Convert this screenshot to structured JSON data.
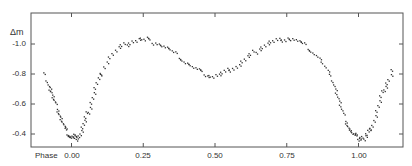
{
  "chart_data": {
    "type": "scatter",
    "title": "",
    "xlabel": "Phase",
    "ylabel": "Δm",
    "xlim": [
      -0.14,
      1.16
    ],
    "ylim": [
      -0.35,
      -1.13
    ],
    "y_inverted": true,
    "grid": false,
    "legend": null,
    "x_ticks": [
      0.0,
      0.25,
      0.5,
      0.75,
      1.0
    ],
    "x_tick_labels": [
      "0.00",
      "0.25",
      "0.50",
      "0.75",
      "1.00"
    ],
    "y_ticks": [
      -1.0,
      -0.8,
      -0.6,
      -0.4
    ],
    "y_tick_labels": [
      "-1.0",
      "-0.8",
      "-0.6",
      "-0.4"
    ],
    "series": [
      {
        "name": "light curve",
        "marker": "dot",
        "points": [
          [
            -0.095,
            -0.8
          ],
          [
            -0.09,
            -0.77
          ],
          [
            -0.085,
            -0.74
          ],
          [
            -0.08,
            -0.72
          ],
          [
            -0.078,
            -0.7
          ],
          [
            -0.075,
            -0.69
          ],
          [
            -0.07,
            -0.66
          ],
          [
            -0.066,
            -0.64
          ],
          [
            -0.062,
            -0.62
          ],
          [
            -0.058,
            -0.6
          ],
          [
            -0.055,
            -0.58
          ],
          [
            -0.05,
            -0.56
          ],
          [
            -0.046,
            -0.54
          ],
          [
            -0.042,
            -0.52
          ],
          [
            -0.038,
            -0.5
          ],
          [
            -0.034,
            -0.48
          ],
          [
            -0.03,
            -0.46
          ],
          [
            -0.026,
            -0.44
          ],
          [
            -0.022,
            -0.43
          ],
          [
            -0.018,
            -0.41
          ],
          [
            -0.014,
            -0.4
          ],
          [
            -0.01,
            -0.4
          ],
          [
            -0.006,
            -0.39
          ],
          [
            -0.002,
            -0.39
          ],
          [
            0.002,
            -0.4
          ],
          [
            0.006,
            -0.38
          ],
          [
            0.01,
            -0.39
          ],
          [
            0.014,
            -0.37
          ],
          [
            0.018,
            -0.38
          ],
          [
            0.022,
            -0.4
          ],
          [
            0.026,
            -0.41
          ],
          [
            0.03,
            -0.43
          ],
          [
            0.034,
            -0.45
          ],
          [
            0.038,
            -0.47
          ],
          [
            0.042,
            -0.49
          ],
          [
            0.046,
            -0.51
          ],
          [
            0.05,
            -0.54
          ],
          [
            0.055,
            -0.56
          ],
          [
            0.06,
            -0.59
          ],
          [
            0.065,
            -0.62
          ],
          [
            0.07,
            -0.65
          ],
          [
            0.075,
            -0.68
          ],
          [
            0.08,
            -0.71
          ],
          [
            0.085,
            -0.74
          ],
          [
            0.09,
            -0.77
          ],
          [
            0.095,
            -0.79
          ],
          [
            0.1,
            -0.82
          ],
          [
            0.11,
            -0.86
          ],
          [
            0.12,
            -0.89
          ],
          [
            0.13,
            -0.92
          ],
          [
            0.14,
            -0.94
          ],
          [
            0.15,
            -0.96
          ],
          [
            0.16,
            -0.98
          ],
          [
            0.17,
            -0.99
          ],
          [
            0.18,
            -1.0
          ],
          [
            0.19,
            -1.01
          ],
          [
            0.2,
            -1.02
          ],
          [
            0.21,
            -1.03
          ],
          [
            0.22,
            -1.03
          ],
          [
            0.23,
            -1.04
          ],
          [
            0.24,
            -1.04
          ],
          [
            0.25,
            -1.03
          ],
          [
            0.26,
            -1.04
          ],
          [
            0.27,
            -1.03
          ],
          [
            0.28,
            -1.02
          ],
          [
            0.29,
            -1.02
          ],
          [
            0.3,
            -1.01
          ],
          [
            0.31,
            -1.0
          ],
          [
            0.32,
            -0.99
          ],
          [
            0.33,
            -0.98
          ],
          [
            0.34,
            -0.97
          ],
          [
            0.35,
            -0.95
          ],
          [
            0.36,
            -0.94
          ],
          [
            0.37,
            -0.92
          ],
          [
            0.38,
            -0.91
          ],
          [
            0.39,
            -0.89
          ],
          [
            0.4,
            -0.88
          ],
          [
            0.41,
            -0.87
          ],
          [
            0.42,
            -0.85
          ],
          [
            0.43,
            -0.84
          ],
          [
            0.44,
            -0.83
          ],
          [
            0.45,
            -0.82
          ],
          [
            0.46,
            -0.81
          ],
          [
            0.47,
            -0.8
          ],
          [
            0.48,
            -0.8
          ],
          [
            0.49,
            -0.79
          ],
          [
            0.5,
            -0.8
          ],
          [
            0.51,
            -0.8
          ],
          [
            0.52,
            -0.81
          ],
          [
            0.53,
            -0.82
          ],
          [
            0.54,
            -0.83
          ],
          [
            0.55,
            -0.84
          ],
          [
            0.56,
            -0.85
          ],
          [
            0.57,
            -0.86
          ],
          [
            0.58,
            -0.87
          ],
          [
            0.59,
            -0.89
          ],
          [
            0.6,
            -0.9
          ],
          [
            0.61,
            -0.92
          ],
          [
            0.62,
            -0.93
          ],
          [
            0.63,
            -0.95
          ],
          [
            0.64,
            -0.96
          ],
          [
            0.65,
            -0.98
          ],
          [
            0.66,
            -0.99
          ],
          [
            0.67,
            -1.0
          ],
          [
            0.68,
            -1.01
          ],
          [
            0.69,
            -1.02
          ],
          [
            0.7,
            -1.02
          ],
          [
            0.71,
            -1.03
          ],
          [
            0.72,
            -1.03
          ],
          [
            0.73,
            -1.04
          ],
          [
            0.74,
            -1.04
          ],
          [
            0.75,
            -1.05
          ],
          [
            0.76,
            -1.04
          ],
          [
            0.77,
            -1.04
          ],
          [
            0.78,
            -1.03
          ],
          [
            0.79,
            -1.02
          ],
          [
            0.8,
            -1.01
          ],
          [
            0.81,
            -1.0
          ],
          [
            0.82,
            -0.98
          ],
          [
            0.83,
            -0.97
          ],
          [
            0.84,
            -0.95
          ],
          [
            0.85,
            -0.93
          ],
          [
            0.86,
            -0.91
          ],
          [
            0.87,
            -0.88
          ],
          [
            0.88,
            -0.85
          ],
          [
            0.89,
            -0.82
          ],
          [
            0.9,
            -0.79
          ],
          [
            0.905,
            -0.77
          ],
          [
            0.91,
            -0.74
          ],
          [
            0.915,
            -0.71
          ],
          [
            0.92,
            -0.68
          ],
          [
            0.925,
            -0.65
          ],
          [
            0.93,
            -0.62
          ],
          [
            0.935,
            -0.59
          ],
          [
            0.94,
            -0.56
          ],
          [
            0.945,
            -0.53
          ],
          [
            0.95,
            -0.5
          ],
          [
            0.955,
            -0.48
          ],
          [
            0.96,
            -0.46
          ],
          [
            0.965,
            -0.44
          ],
          [
            0.97,
            -0.43
          ],
          [
            0.975,
            -0.41
          ],
          [
            0.98,
            -0.4
          ],
          [
            0.985,
            -0.4
          ],
          [
            0.99,
            -0.39
          ],
          [
            0.995,
            -0.38
          ],
          [
            1.0,
            -0.39
          ],
          [
            1.005,
            -0.38
          ],
          [
            1.01,
            -0.39
          ],
          [
            1.015,
            -0.37
          ],
          [
            1.02,
            -0.39
          ],
          [
            1.025,
            -0.4
          ],
          [
            1.03,
            -0.42
          ],
          [
            1.035,
            -0.43
          ],
          [
            1.04,
            -0.45
          ],
          [
            1.045,
            -0.47
          ],
          [
            1.05,
            -0.5
          ],
          [
            1.055,
            -0.53
          ],
          [
            1.06,
            -0.56
          ],
          [
            1.065,
            -0.59
          ],
          [
            1.07,
            -0.62
          ],
          [
            1.075,
            -0.65
          ],
          [
            1.08,
            -0.68
          ],
          [
            1.085,
            -0.71
          ],
          [
            1.09,
            -0.73
          ],
          [
            1.095,
            -0.75
          ],
          [
            1.1,
            -0.77
          ],
          [
            1.11,
            -0.8
          ],
          [
            1.115,
            -0.83
          ]
        ]
      }
    ],
    "annotations": []
  },
  "axes": {
    "ylabel": "Δm",
    "xlabel": "Phase",
    "x_tick_labels": [
      "0.00",
      "0.25",
      "0.50",
      "0.75",
      "1.00"
    ],
    "y_tick_labels": [
      "-1.0",
      "-0.8",
      "-0.6",
      "-0.4"
    ]
  }
}
